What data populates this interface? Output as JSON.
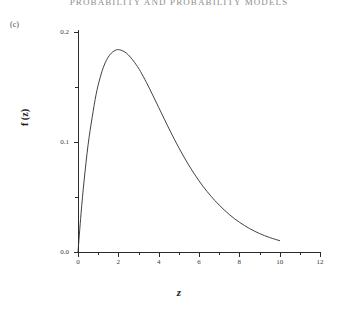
{
  "page": {
    "running_head": "PROBABILITY AND PROBABILITY MODELS",
    "panel_label": "(c)"
  },
  "chart_data": {
    "type": "line",
    "title": "",
    "subtitle": "",
    "xlabel": "z",
    "ylabel": "f (z)",
    "xlim": [
      0,
      12
    ],
    "ylim": [
      0.0,
      0.2
    ],
    "grid": false,
    "legend": null,
    "x_ticks": [
      0,
      2,
      4,
      6,
      8,
      10,
      12
    ],
    "x_tick_labels": [
      "0",
      "2",
      "4",
      "6",
      "8",
      "10",
      "12"
    ],
    "x_minor_ticks": [
      1,
      3,
      5,
      7,
      9,
      11
    ],
    "y_ticks": [
      0.0,
      0.1,
      0.2
    ],
    "y_tick_labels": [
      "0.0",
      "0.1",
      "0.2"
    ],
    "y_minor_ticks": [
      0.05,
      0.15
    ],
    "series": [
      {
        "name": "f(z)",
        "color": "#2b2b2b",
        "x": [
          0.0,
          0.15,
          0.3,
          0.5,
          0.7,
          0.9,
          1.1,
          1.3,
          1.5,
          1.7,
          1.9,
          2.0,
          2.1,
          2.3,
          2.5,
          2.7,
          2.9,
          3.1,
          3.4,
          3.7,
          4.0,
          4.3,
          4.6,
          5.0,
          5.4,
          5.8,
          6.2,
          6.6,
          7.0,
          7.5,
          8.0,
          8.5,
          9.0,
          9.5,
          10.0
        ],
        "y": [
          0.0,
          0.0348,
          0.0645,
          0.0974,
          0.1221,
          0.1435,
          0.1587,
          0.1699,
          0.1772,
          0.1816,
          0.1838,
          0.1839,
          0.1837,
          0.1821,
          0.1791,
          0.1749,
          0.1699,
          0.1641,
          0.1539,
          0.1428,
          0.1315,
          0.1201,
          0.1089,
          0.0948,
          0.0818,
          0.0701,
          0.0597,
          0.0506,
          0.0427,
          0.0341,
          0.0271,
          0.0214,
          0.0168,
          0.0132,
          0.0103
        ]
      }
    ]
  }
}
